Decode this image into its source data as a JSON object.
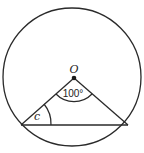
{
  "diagram": {
    "type": "circle-geometry",
    "circle": {
      "cx": 72,
      "cy": 77,
      "r": 69
    },
    "center": {
      "label": "O",
      "x": 74,
      "y": 78
    },
    "chord": {
      "left": {
        "x": 21,
        "y": 125
      },
      "right": {
        "x": 128,
        "y": 125
      }
    },
    "angles": {
      "central": {
        "label": "100°",
        "value": 100
      },
      "base": {
        "label": "c"
      }
    },
    "colors": {
      "stroke": "#2a2a2a",
      "background": "#ffffff"
    }
  }
}
